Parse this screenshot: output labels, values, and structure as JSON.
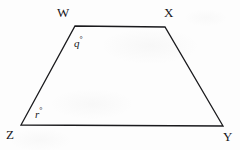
{
  "figure": {
    "name": "trapezoid-wxyz",
    "background_color": "#fdfdfd",
    "stroke_color": "#1a1a1d",
    "stroke_width": 1.3,
    "vertices": [
      {
        "id": "W",
        "label": "W",
        "x": 75,
        "y": 26
      },
      {
        "id": "X",
        "label": "X",
        "x": 165,
        "y": 27
      },
      {
        "id": "Y",
        "label": "Y",
        "x": 223,
        "y": 126
      },
      {
        "id": "Z",
        "label": "Z",
        "x": 21,
        "y": 125
      }
    ],
    "edges": [
      {
        "id": "WX",
        "from": "W",
        "to": "X"
      },
      {
        "id": "XY",
        "from": "X",
        "to": "Y"
      },
      {
        "id": "YZ",
        "from": "Y",
        "to": "Z"
      },
      {
        "id": "ZW",
        "from": "Z",
        "to": "W"
      }
    ],
    "angle_labels": [
      {
        "id": "q",
        "at_vertex": "W",
        "variable": "q",
        "unit": "°",
        "text": "q"
      },
      {
        "id": "r",
        "at_vertex": "Z",
        "variable": "r",
        "unit": "°",
        "text": "r"
      }
    ],
    "degree_symbol": "°"
  }
}
